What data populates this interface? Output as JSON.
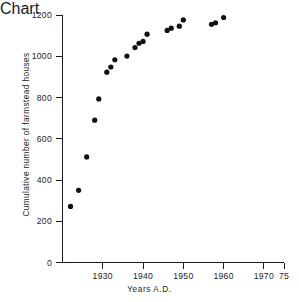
{
  "chart_data": {
    "type": "scatter",
    "title": "",
    "xlabel": "Years A.D.",
    "ylabel": "Cumulative number of farmstead houses",
    "xlim": [
      1920,
      1975
    ],
    "ylim": [
      0,
      1200
    ],
    "grid": false,
    "legend": null,
    "xticks": [
      1930,
      1940,
      1950,
      1960,
      1970,
      1975
    ],
    "xticklabels": [
      "1930",
      "1940",
      "1950",
      "1960",
      "1970",
      "75"
    ],
    "yticks": [
      0,
      200,
      400,
      600,
      800,
      1000,
      1200
    ],
    "yticklabels": [
      "0",
      "200",
      "400",
      "600",
      "800",
      "1000",
      "1200"
    ],
    "x": [
      1922,
      1924,
      1926,
      1928,
      1929,
      1931,
      1932,
      1933,
      1936,
      1938,
      1939,
      1940,
      1941,
      1946,
      1947,
      1949,
      1950,
      1957,
      1958,
      1960
    ],
    "y": [
      272,
      350,
      512,
      690,
      793,
      923,
      948,
      983,
      1001,
      1042,
      1063,
      1072,
      1107,
      1125,
      1136,
      1146,
      1176,
      1155,
      1162,
      1188
    ],
    "marker": "circle",
    "marker_color": "#111111",
    "marker_size": 4
  },
  "axes": {
    "x_axis_name": "years-axis",
    "y_axis_name": "cumulative-count-axis"
  }
}
